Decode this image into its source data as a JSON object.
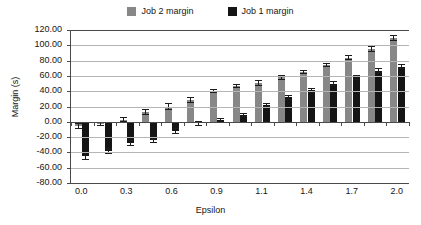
{
  "chart_data": {
    "type": "bar",
    "title": "",
    "xlabel": "Epsilon",
    "ylabel": "Margin (s)",
    "ylim": [
      -80,
      120
    ],
    "ytick_step": 20,
    "ytick_labels": [
      "120.00",
      "100.00",
      "80.00",
      "60.00",
      "40.00",
      "20.00",
      "0.00",
      "-20.00",
      "-40.00",
      "-60.00",
      "-80.00"
    ],
    "ytick_values": [
      120,
      100,
      80,
      60,
      40,
      20,
      0,
      -20,
      -40,
      -60,
      -80
    ],
    "xtick_labels": [
      "0.0",
      "0.3",
      "0.6",
      "0.9",
      "1.1",
      "1.4",
      "1.7",
      "2.0"
    ],
    "grid": true,
    "legend_position": "top-center",
    "group_count": 15,
    "categories": [
      "0.0",
      "0.1",
      "0.3",
      "0.4",
      "0.6",
      "0.7",
      "0.9",
      "1.0",
      "1.1",
      "1.3",
      "1.4",
      "1.6",
      "1.7",
      "1.9",
      "2.0"
    ],
    "series": [
      {
        "name": "Job 2 margin",
        "color": "#878787",
        "values": [
          -5,
          -3,
          3,
          13,
          20,
          28,
          40,
          47,
          51,
          58,
          65,
          74,
          84,
          95,
          110
        ],
        "errors": [
          4,
          3,
          3,
          4,
          4,
          4,
          3,
          3,
          4,
          3,
          3,
          3,
          3,
          4,
          4
        ]
      },
      {
        "name": "Job 1 margin",
        "color": "#151515",
        "values": [
          -45,
          -38,
          -28,
          -24,
          -12,
          -2,
          2,
          9,
          22,
          32,
          41,
          50,
          58,
          67,
          72
        ],
        "errors": [
          5,
          4,
          4,
          4,
          4,
          3,
          3,
          3,
          3,
          3,
          3,
          3,
          3,
          3,
          3
        ]
      }
    ]
  },
  "legend": {
    "items": [
      {
        "label": "Job 2 margin",
        "color": "#878787"
      },
      {
        "label": "Job 1 margin",
        "color": "#151515"
      }
    ]
  },
  "axes": {
    "y_title": "Margin (s)",
    "x_title": "Epsilon"
  }
}
